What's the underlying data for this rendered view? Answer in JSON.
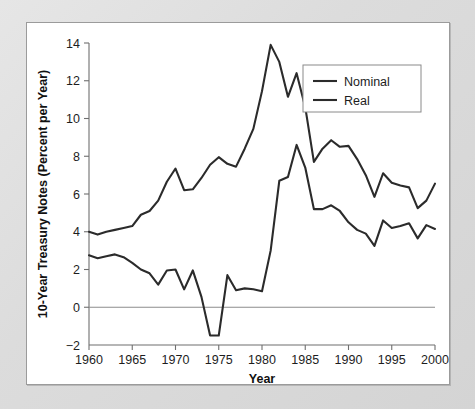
{
  "chart_data": {
    "type": "line",
    "title": "",
    "xlabel": "Year",
    "ylabel": "10-Year Treasury Notes (Percent per Year)",
    "xlim": [
      1960,
      2000
    ],
    "ylim": [
      -2,
      14
    ],
    "xticks": [
      1960,
      1965,
      1970,
      1975,
      1980,
      1985,
      1990,
      1995,
      2000
    ],
    "yticks": [
      -2,
      0,
      2,
      4,
      6,
      8,
      10,
      12,
      14
    ],
    "xtick_labels": [
      "1960",
      "1965",
      "1970",
      "1975",
      "1980",
      "1985",
      "1990",
      "1995",
      "2000"
    ],
    "ytick_labels": [
      "-2",
      "0",
      "2",
      "4",
      "6",
      "8",
      "10",
      "12",
      "14"
    ],
    "grid": false,
    "zero_line": true,
    "legend_position": "upper-right",
    "line_color": "#2b2b2b",
    "x": [
      1960,
      1961,
      1962,
      1963,
      1964,
      1965,
      1966,
      1967,
      1968,
      1969,
      1970,
      1971,
      1972,
      1973,
      1974,
      1975,
      1976,
      1977,
      1978,
      1979,
      1980,
      1981,
      1982,
      1983,
      1984,
      1985,
      1986,
      1987,
      1988,
      1989,
      1990,
      1991,
      1992,
      1993,
      1994,
      1995,
      1996,
      1997,
      1998,
      1999,
      2000
    ],
    "series": [
      {
        "name": "Nominal",
        "values": [
          4.0,
          3.85,
          4.0,
          4.1,
          4.2,
          4.3,
          4.9,
          5.1,
          5.65,
          6.65,
          7.35,
          6.2,
          6.25,
          6.85,
          7.55,
          7.95,
          7.6,
          7.45,
          8.4,
          9.45,
          11.45,
          13.9,
          13.0,
          11.15,
          12.4,
          10.6,
          7.7,
          8.4,
          8.85,
          8.5,
          8.55,
          7.85,
          7.0,
          5.85,
          7.1,
          6.6,
          6.45,
          6.35,
          5.25,
          5.65,
          6.55
        ]
      },
      {
        "name": "Real",
        "values": [
          2.75,
          2.6,
          2.7,
          2.8,
          2.65,
          2.35,
          2.0,
          1.8,
          1.2,
          1.95,
          2.0,
          0.95,
          1.95,
          0.55,
          -1.5,
          -1.5,
          1.7,
          0.9,
          1.0,
          0.95,
          0.85,
          3.0,
          6.7,
          6.9,
          8.6,
          7.4,
          5.2,
          5.2,
          5.4,
          5.1,
          4.5,
          4.1,
          3.9,
          3.25,
          4.6,
          4.2,
          4.3,
          4.45,
          3.65,
          4.35,
          4.15
        ]
      }
    ]
  },
  "legend": {
    "items": [
      {
        "label": "Nominal"
      },
      {
        "label": "Real"
      }
    ]
  },
  "axes": {
    "x_title": "Year",
    "y_title": "10-Year Treasury Notes (Percent per Year)"
  }
}
